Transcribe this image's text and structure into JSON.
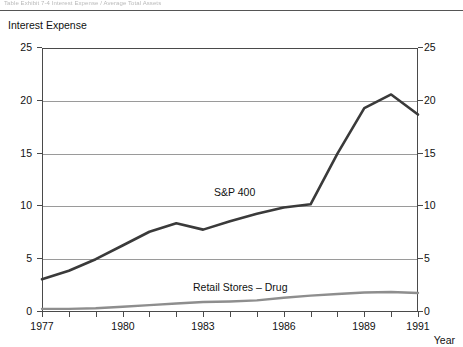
{
  "header": {
    "ghost_running_head": "Table Exhibit 7-4  Interest Expense / Average Total Assets",
    "rule_color": "#555555"
  },
  "chart_caption": "Interest Expense",
  "x_axis_title": "Year",
  "axes": {
    "y_ticks": [
      "0",
      "5",
      "10",
      "15",
      "20",
      "25"
    ],
    "x_ticks": [
      "1977",
      "1980",
      "1983",
      "1986",
      "1989",
      "1991"
    ],
    "y_min": 0,
    "y_max": 25
  },
  "series_labels": {
    "sp400": "S&P 400",
    "retail": "Retail Stores – Drug"
  },
  "colors": {
    "sp400": "#3a3a3a",
    "retail": "#8e8e8e",
    "axis": "#4a4a4a",
    "grid": "#9a9a9a"
  },
  "chart_data": {
    "type": "line",
    "title": "Interest Expense",
    "xlabel": "Year",
    "ylabel": "Interest Expense",
    "xlim": [
      1977,
      1991
    ],
    "ylim": [
      0,
      25
    ],
    "grid": true,
    "dual_y_axis": true,
    "legend_position": "inline-annotation",
    "x": [
      1977,
      1978,
      1979,
      1980,
      1981,
      1982,
      1983,
      1984,
      1985,
      1986,
      1987,
      1988,
      1989,
      1990,
      1991
    ],
    "xticks": [
      1977,
      1980,
      1983,
      1986,
      1989,
      1991
    ],
    "yticks": [
      0,
      5,
      10,
      15,
      20,
      25
    ],
    "series": [
      {
        "name": "S&P 400",
        "color": "#3a3a3a",
        "values": [
          3.1,
          3.9,
          5.0,
          6.3,
          7.6,
          8.4,
          7.8,
          8.6,
          9.3,
          9.9,
          10.2,
          15.0,
          19.3,
          20.6,
          18.7
        ]
      },
      {
        "name": "Retail Stores – Drug",
        "color": "#8e8e8e",
        "values": [
          0.3,
          0.3,
          0.35,
          0.5,
          0.65,
          0.8,
          0.95,
          1.0,
          1.1,
          1.35,
          1.55,
          1.7,
          1.85,
          1.9,
          1.8
        ]
      }
    ],
    "annotations": [
      {
        "text": "S&P 400",
        "x": 1984.2,
        "y": 11.0
      },
      {
        "text": "Retail Stores – Drug",
        "x": 1983.1,
        "y": 2.8
      }
    ]
  }
}
